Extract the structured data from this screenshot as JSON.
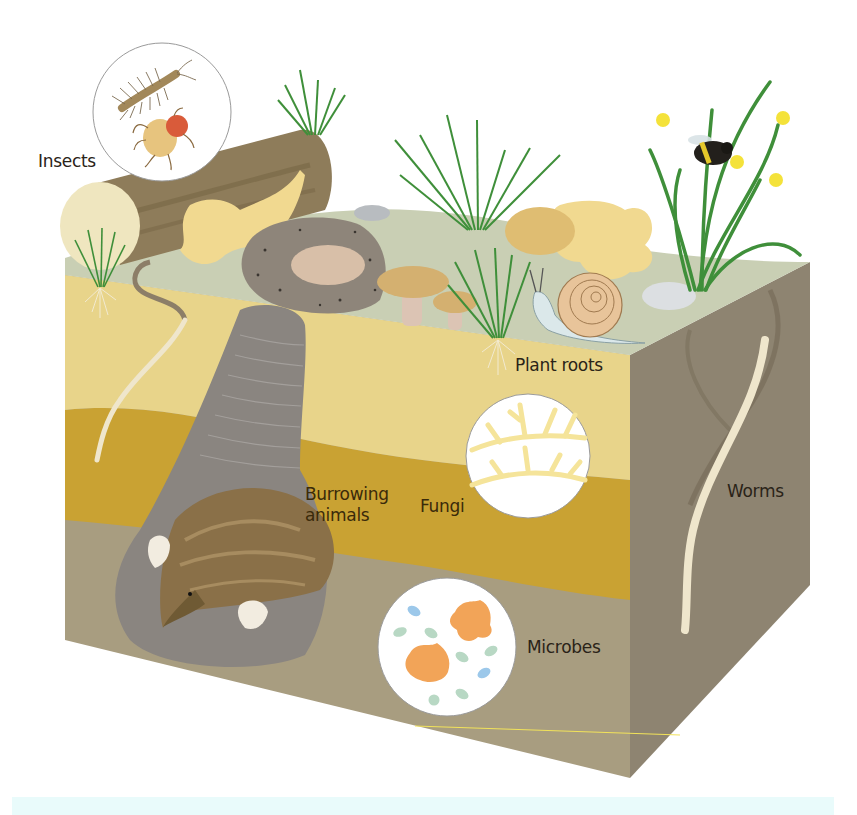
{
  "figure": {
    "labels": {
      "insects": "Insects",
      "plant_roots": "Plant roots",
      "burrowing_animals_line1": "Burrowing",
      "burrowing_animals_line2": "animals",
      "fungi": "Fungi",
      "microbes": "Microbes",
      "worms": "Worms"
    },
    "colors": {
      "top_surface": "#c9cfb4",
      "topsoil": "#e8d48a",
      "subsoil": "#c9a233",
      "deep_soil": "#a89d80",
      "right_face": "#8e8471",
      "burrow": "#8a8580",
      "grass": "#3f8f3a",
      "log": "#8e7c5a",
      "log_end": "#efe6bf",
      "leaf": "#f1d990",
      "mushroom_cap": "#d4b070",
      "mushroom_stem": "#dcc4b4",
      "snail_body": "#dbe8ea",
      "snail_shell": "#e8c49a",
      "mole_fur": "#8a7048",
      "fungi_hyphae": "#f5e49a",
      "microbe_orange": "#f2a458",
      "microbe_green": "#b8d8c4",
      "microbe_blue": "#9cc8ea",
      "worm": "#efe6cc",
      "daffodil": "#f4e23a",
      "caption_band": "#e9fbfb"
    }
  }
}
